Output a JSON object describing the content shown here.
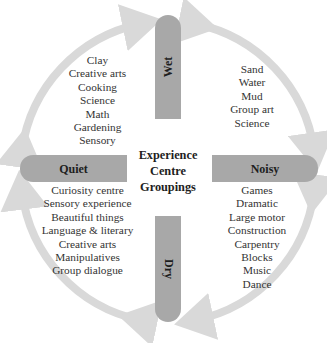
{
  "title": "Experience Centre Groupings",
  "center": {
    "lines": [
      "Experience",
      "Centre",
      "Groupings"
    ]
  },
  "axes": {
    "top": {
      "label": "Wet"
    },
    "bottom": {
      "label": "Dry"
    },
    "left": {
      "label": "Quiet"
    },
    "right": {
      "label": "Noisy"
    }
  },
  "quadrants": {
    "wet_quiet": {
      "items": [
        "Clay",
        "Creative arts",
        "Cooking",
        "Science",
        "Math",
        "Gardening",
        "Sensory"
      ]
    },
    "wet_noisy": {
      "items": [
        "Sand",
        "Water",
        "Mud",
        "Group art",
        "Science"
      ]
    },
    "dry_quiet": {
      "items": [
        "Curiosity centre",
        "Sensory experience",
        "Beautiful things",
        "Language & literary",
        "Creative arts",
        "Manipulatives",
        "Group dialogue"
      ]
    },
    "dry_noisy": {
      "items": [
        "Games",
        "Dramatic",
        "Large motor",
        "Construction",
        "Carpentry",
        "Blocks",
        "Music",
        "Dance"
      ]
    }
  },
  "colors": {
    "bar": "#a8a8a8",
    "arrow": "#d9d9d9",
    "text": "#2b2b2b"
  }
}
